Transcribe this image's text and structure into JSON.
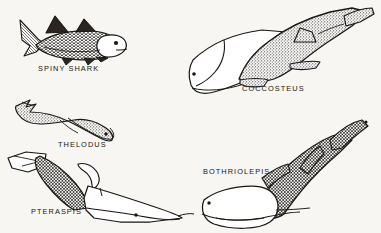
{
  "plate": {
    "background_color": "#f7f6f2",
    "ink_color": "#17140f",
    "kind": "scientific-illustration-plate",
    "subject": "prehistoric armored and early fishes",
    "figure_count": 5
  },
  "figures": [
    {
      "id": "spiny-shark",
      "label": "SPINY SHARK",
      "position": "upper-left",
      "shading": "scaled",
      "orientation": "head-right",
      "label_x": 38,
      "label_y": 64
    },
    {
      "id": "coccosteus",
      "label": "COCCOSTEUS",
      "position": "upper-right",
      "shading": "stippled",
      "orientation": "head-lower-left",
      "label_x": 242,
      "label_y": 84
    },
    {
      "id": "thelodus",
      "label": "THELODUS",
      "position": "middle-left",
      "shading": "stippled",
      "orientation": "head-lower-right",
      "label_x": 58,
      "label_y": 140
    },
    {
      "id": "pteraspis",
      "label": "PTERASPIS",
      "position": "lower-left",
      "shading": "cross-hatched",
      "orientation": "head-lower-right",
      "label_x": 31,
      "label_y": 207
    },
    {
      "id": "bothriolepis",
      "label": "BOTHRIOLEPIS",
      "position": "lower-right",
      "shading": "cross-hatched",
      "orientation": "head-lower-left",
      "label_x": 203,
      "label_y": 167
    }
  ]
}
